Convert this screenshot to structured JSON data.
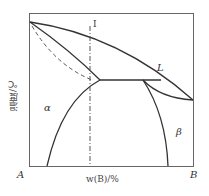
{
  "diagram": {
    "type": "binary-phase-diagram",
    "y_axis_label": "温度/℃",
    "x_axis_label": "w(B)/%",
    "corner_left": "A",
    "corner_right": "B",
    "phase_labels": {
      "liquid": "L",
      "alpha": "α",
      "beta": "β"
    },
    "alloy_line_label": "I",
    "colors": {
      "line": "#333333",
      "frame": "#555555"
    }
  }
}
